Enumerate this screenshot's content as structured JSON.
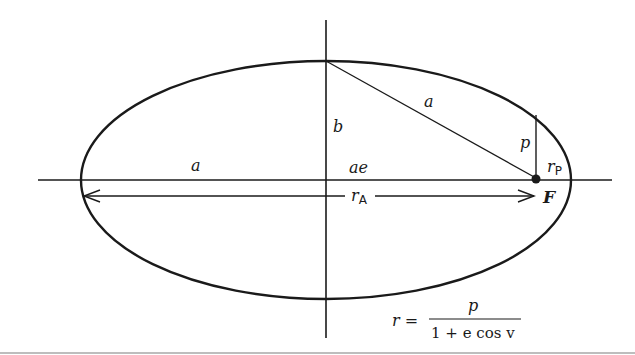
{
  "diagram": {
    "colors": {
      "stroke": "#1a1a1a",
      "background": "#ffffff"
    },
    "labels": {
      "semi_major_left": "a",
      "semi_major_diag": "a",
      "semi_minor": "b",
      "focal_offset": "ae",
      "semi_latus": "p",
      "periapsis_r": "r",
      "periapsis_sub": "P",
      "apoapsis_r": "r",
      "apoapsis_sub": "A",
      "focus": "F"
    },
    "equation": {
      "lhs": "r =",
      "numerator": "p",
      "denominator": "1 + e cos v"
    }
  }
}
